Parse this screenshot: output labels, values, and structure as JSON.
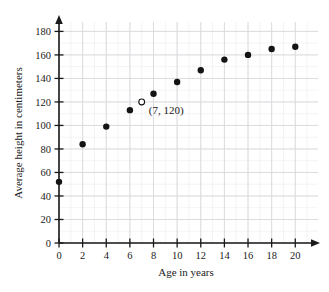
{
  "chart_data": {
    "type": "scatter",
    "title": "",
    "xlabel": "Age in years",
    "ylabel": "Average height in centimeters",
    "xlim": [
      0,
      21.5
    ],
    "ylim": [
      0,
      188
    ],
    "xticks": [
      0,
      2,
      4,
      6,
      8,
      10,
      12,
      14,
      16,
      18,
      20
    ],
    "yticks": [
      0,
      20,
      40,
      60,
      80,
      100,
      120,
      140,
      160,
      180
    ],
    "xtick_labels": [
      "0",
      "2",
      "4",
      "6",
      "8",
      "10",
      "12",
      "14",
      "16",
      "18",
      "20"
    ],
    "ytick_labels": [
      "0",
      "20",
      "40",
      "60",
      "80",
      "100",
      "120",
      "140",
      "160",
      "180"
    ],
    "grid": true,
    "legend": "none",
    "x": [
      0,
      2,
      4,
      6,
      8,
      10,
      12,
      14,
      16,
      18,
      20
    ],
    "values": [
      52,
      84,
      99,
      113,
      127,
      137,
      147,
      156,
      160,
      165,
      167
    ],
    "series": [
      {
        "name": "Average height",
        "marker": "filled-circle",
        "points": [
          {
            "x": 0,
            "y": 52
          },
          {
            "x": 2,
            "y": 84
          },
          {
            "x": 4,
            "y": 99
          },
          {
            "x": 6,
            "y": 113
          },
          {
            "x": 8,
            "y": 127
          },
          {
            "x": 10,
            "y": 137
          },
          {
            "x": 12,
            "y": 147
          },
          {
            "x": 14,
            "y": 156
          },
          {
            "x": 16,
            "y": 160
          },
          {
            "x": 18,
            "y": 165
          },
          {
            "x": 20,
            "y": 167
          }
        ]
      },
      {
        "name": "Highlighted point",
        "marker": "open-circle",
        "points": [
          {
            "x": 7,
            "y": 120
          }
        ]
      }
    ],
    "annotations": [
      {
        "text": "(7, 120)",
        "x": 7,
        "y": 120,
        "label_x": 7.6,
        "label_y": 113
      }
    ]
  },
  "colors": {
    "point_fill": "#141414",
    "point_open_fill": "#ffffff",
    "axis": "#1a1a1a",
    "grid_major": "#d8d8de",
    "grid_minor": "#ececed",
    "background": "#ffffff"
  }
}
